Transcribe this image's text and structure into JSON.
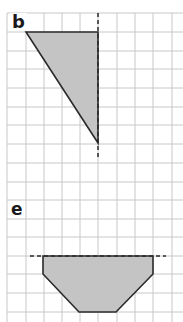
{
  "panels": [
    {
      "label": "b",
      "shape": "right triangle",
      "vertices": [
        [
          26,
          32
        ],
        [
          98,
          32
        ],
        [
          98,
          143
        ]
      ],
      "mirror_line": {
        "orientation": "vertical",
        "x": 98,
        "y1": 13,
        "y2": 160
      }
    },
    {
      "label": "e",
      "shape": "trapezoid-like hexagon",
      "vertices": [
        [
          43,
          256
        ],
        [
          153,
          256
        ],
        [
          153,
          274
        ],
        [
          116,
          312
        ],
        [
          79,
          312
        ],
        [
          43,
          274
        ]
      ],
      "mirror_line": {
        "orientation": "horizontal",
        "y": 256,
        "x1": 30,
        "x2": 166
      }
    }
  ],
  "grid": {
    "cell_size": 18.6,
    "x_lines": [
      7,
      26,
      44,
      62,
      80,
      98,
      117,
      135,
      153,
      172
    ],
    "y_lines": [
      13,
      32,
      51,
      69,
      88,
      107,
      125,
      144,
      163,
      182,
      200,
      219,
      237,
      256,
      274,
      293,
      312
    ],
    "line_color": "#c8c8c8"
  },
  "colors": {
    "shape_fill": "#c4c4c4",
    "shape_stroke": "#2a2a2a",
    "mirror_line": "#2a2a2a"
  }
}
